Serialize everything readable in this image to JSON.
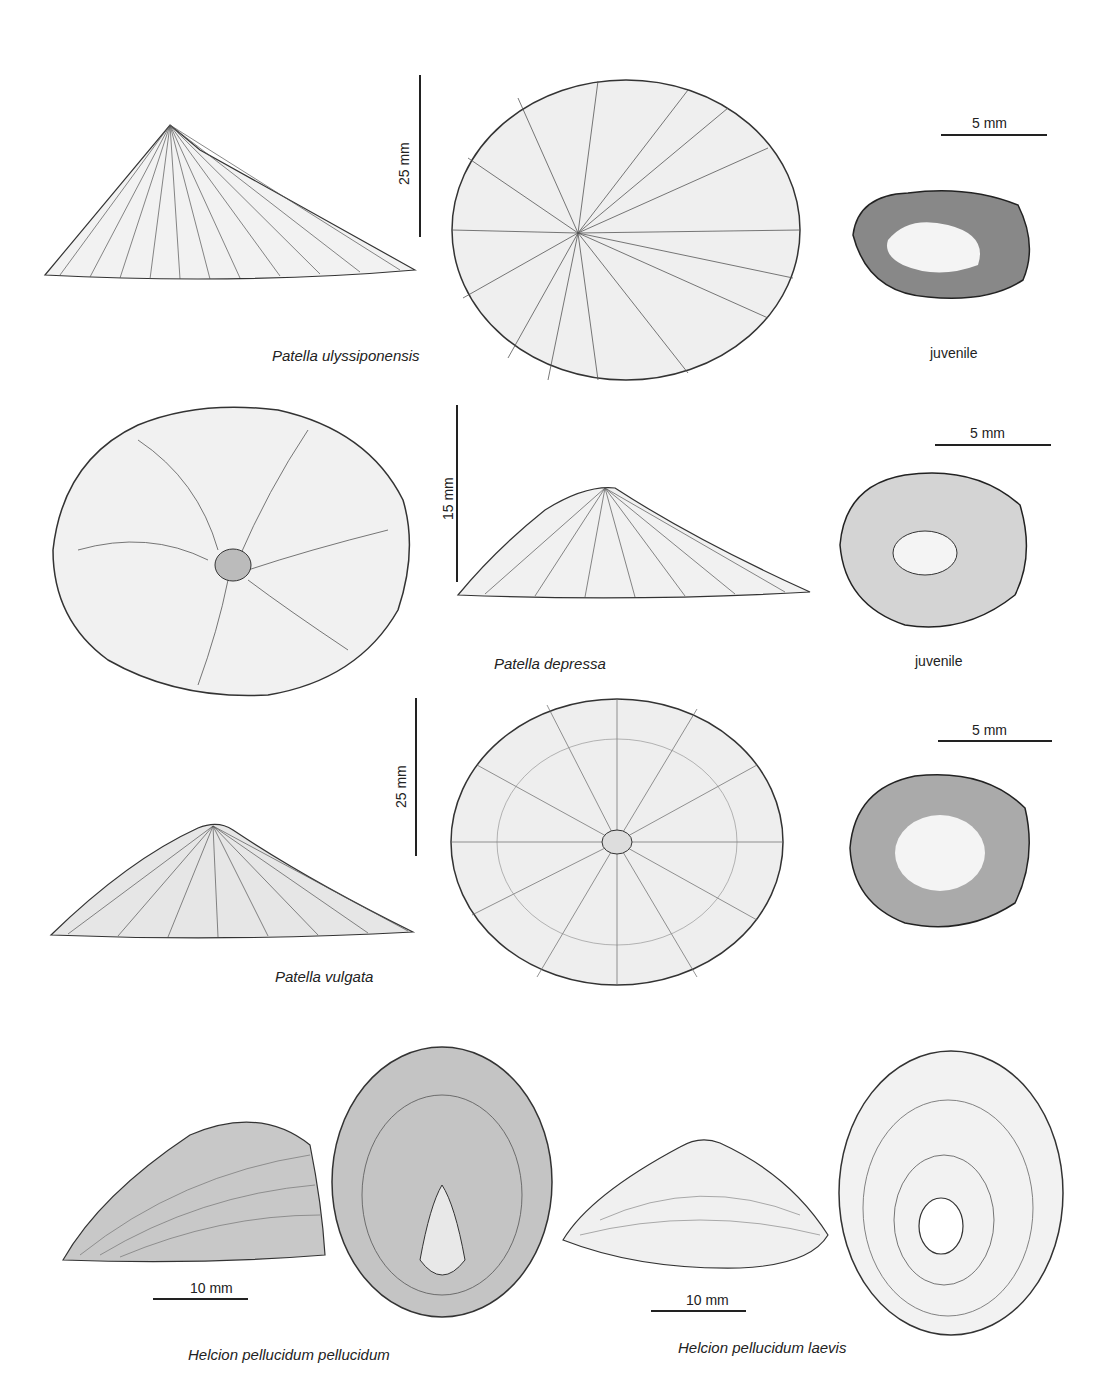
{
  "plate": {
    "rows": [
      {
        "species": "Patella ulyssiponensis",
        "views": [
          "side-view",
          "dorsal-view",
          "juvenile-ventral"
        ],
        "scale_vertical": "25 mm",
        "juvenile_label": "juvenile",
        "juvenile_scale": "5 mm"
      },
      {
        "species": "Patella depressa",
        "views": [
          "dorsal-view",
          "side-view",
          "juvenile-dorsal"
        ],
        "scale_vertical": "15 mm",
        "juvenile_label": "juvenile",
        "juvenile_scale": "5 mm"
      },
      {
        "species": "Patella vulgata",
        "views": [
          "side-view",
          "dorsal-view",
          "juvenile-ventral"
        ],
        "scale_vertical": "25 mm",
        "juvenile_scale": "5 mm"
      },
      {
        "species": "Helcion pellucidum pellucidum",
        "views": [
          "side-view",
          "dorsal-view"
        ],
        "scale_horizontal": "10 mm"
      },
      {
        "species": "Helcion pellucidum laevis",
        "views": [
          "side-view",
          "dorsal-view"
        ],
        "scale_horizontal": "10 mm"
      }
    ]
  },
  "colors": {
    "ink": "#222222",
    "background": "#ffffff"
  }
}
